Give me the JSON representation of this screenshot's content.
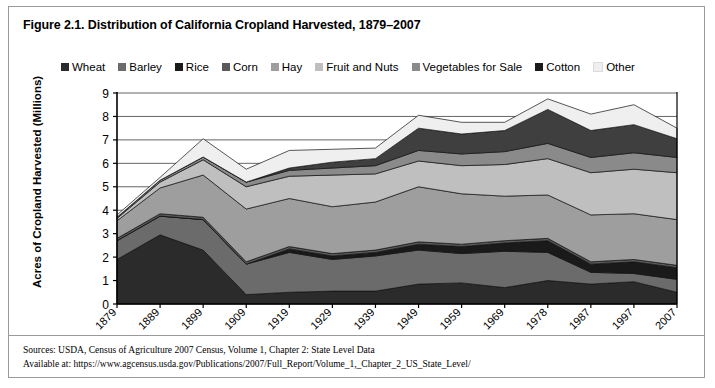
{
  "figure": {
    "title": "Figure 2.1. Distribution of California Cropland Harvested, 1879–2007",
    "sources_line1": "Sources: USDA, Census of Agriculture 2007 Census, Volume 1, Chapter 2: State Level Data",
    "sources_line2": "Available at: https://www.agcensus.usda.gov/Publications/2007/Full_Report/Volume_1,_Chapter_2_US_State_Level/"
  },
  "chart_data": {
    "type": "area",
    "stacked": true,
    "title": "Figure 2.1. Distribution of California Cropland Harvested, 1879–2007",
    "xlabel": "",
    "ylabel": "Acres of Cropland Harvested (Millions)",
    "ylim": [
      0,
      9
    ],
    "ytick_labels": [
      "0",
      "1",
      "2",
      "3",
      "4",
      "5",
      "6",
      "7",
      "8",
      "9"
    ],
    "yticks": [
      0,
      1,
      2,
      3,
      4,
      5,
      6,
      7,
      8,
      9
    ],
    "grid": true,
    "legend_position": "top",
    "categories": [
      "1879",
      "1889",
      "1899",
      "1909",
      "1919",
      "1929",
      "1939",
      "1949",
      "1959",
      "1969",
      "1978",
      "1987",
      "1997",
      "2007"
    ],
    "series": [
      {
        "name": "Wheat",
        "color": "#2b2b2b",
        "values": [
          1.9,
          2.95,
          2.3,
          0.4,
          0.5,
          0.55,
          0.55,
          0.85,
          0.9,
          0.7,
          1.0,
          0.85,
          0.95,
          0.5
        ]
      },
      {
        "name": "Barley",
        "color": "#6b6b6b",
        "values": [
          0.8,
          0.8,
          1.3,
          1.3,
          1.7,
          1.35,
          1.5,
          1.45,
          1.25,
          1.55,
          1.2,
          0.5,
          0.35,
          0.55
        ]
      },
      {
        "name": "Rice",
        "color": "#1a1a1a",
        "values": [
          0.0,
          0.0,
          0.0,
          0.0,
          0.15,
          0.15,
          0.15,
          0.25,
          0.3,
          0.35,
          0.5,
          0.35,
          0.5,
          0.5
        ]
      },
      {
        "name": "Corn",
        "color": "#5a5a5a",
        "values": [
          0.1,
          0.1,
          0.1,
          0.1,
          0.1,
          0.1,
          0.1,
          0.1,
          0.1,
          0.1,
          0.1,
          0.1,
          0.1,
          0.1
        ]
      },
      {
        "name": "Hay",
        "color": "#9e9e9e",
        "values": [
          0.75,
          1.1,
          1.8,
          2.25,
          2.05,
          2.0,
          2.05,
          2.35,
          2.15,
          1.9,
          1.85,
          2.0,
          1.95,
          1.95
        ]
      },
      {
        "name": "Fruit and Nuts",
        "color": "#bfbfbf",
        "values": [
          0.1,
          0.25,
          0.65,
          0.95,
          0.95,
          1.35,
          1.2,
          1.1,
          1.2,
          1.35,
          1.55,
          1.8,
          1.9,
          2.0
        ]
      },
      {
        "name": "Vegetables for Sale",
        "color": "#8a8a8a",
        "values": [
          0.05,
          0.08,
          0.12,
          0.2,
          0.25,
          0.3,
          0.35,
          0.45,
          0.5,
          0.55,
          0.65,
          0.65,
          0.7,
          0.65
        ]
      },
      {
        "name": "Cotton",
        "color": "#3f3f3f",
        "values": [
          0.0,
          0.0,
          0.0,
          0.0,
          0.1,
          0.25,
          0.3,
          0.95,
          0.85,
          0.9,
          1.45,
          1.15,
          1.2,
          0.8
        ]
      },
      {
        "name": "Other",
        "color": "#efefef",
        "values": [
          0.1,
          0.12,
          0.78,
          0.55,
          0.75,
          0.55,
          0.45,
          0.55,
          0.5,
          0.35,
          0.45,
          0.7,
          0.85,
          0.45
        ]
      }
    ],
    "totals": [
      3.8,
      5.4,
      7.05,
      5.75,
      6.55,
      6.6,
      6.65,
      8.05,
      7.75,
      7.75,
      8.75,
      8.1,
      8.5,
      7.5
    ],
    "notable_points": {
      "peak_year": "1978",
      "peak_value": 8.75,
      "start_value": 3.8,
      "end_value": 7.5
    }
  },
  "legend": {
    "items": [
      {
        "label": "Wheat",
        "color": "#2b2b2b"
      },
      {
        "label": "Barley",
        "color": "#6b6b6b"
      },
      {
        "label": "Rice",
        "color": "#1a1a1a"
      },
      {
        "label": "Corn",
        "color": "#5a5a5a"
      },
      {
        "label": "Hay",
        "color": "#9e9e9e"
      },
      {
        "label": "Fruit and Nuts",
        "color": "#bfbfbf"
      },
      {
        "label": "Vegetables for Sale",
        "color": "#8a8a8a"
      },
      {
        "label": "Cotton",
        "color": "#1a1a1a"
      },
      {
        "label": "Other",
        "color": "#efefef"
      }
    ]
  }
}
